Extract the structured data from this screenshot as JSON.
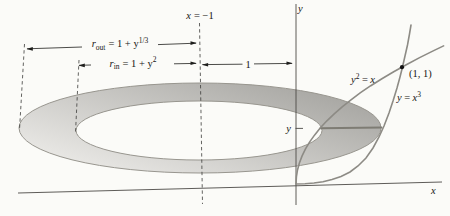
{
  "labels": {
    "rotation_axis": {
      "var": "x",
      "rest": "= −1"
    },
    "outer_radius": {
      "var": "r",
      "sub": "out",
      "rest": "= 1 + y",
      "sup": "1/3"
    },
    "inner_radius": {
      "var": "r",
      "sub": "in",
      "rest": "= 1 + y",
      "sup": "2"
    },
    "offset_one": "1",
    "parabola_label": {
      "var": "y",
      "sup": "2",
      "eq": "=",
      "var2": "x"
    },
    "cubic_label": {
      "var": "y",
      "eq": "=",
      "var2": "x",
      "sup": "3"
    },
    "point_label": "(1, 1)",
    "slice_label": "y",
    "x_axis_label": "x",
    "y_axis_label": "y"
  },
  "colors": {
    "background": "#fbfbf8",
    "washer_light": "#eeedea",
    "washer_dark": "#a7a6a2",
    "washer_stroke": "#98968f",
    "curve": "#8d8b85",
    "slice": "#7e7c74",
    "ink": "#1e1e1c"
  },
  "curves": {
    "parabola": [
      [
        296,
        184
      ],
      [
        296.4,
        177
      ],
      [
        297.5,
        170
      ],
      [
        299.4,
        163
      ],
      [
        302.1,
        155.9
      ],
      [
        305.5,
        148.9
      ],
      [
        309.7,
        141.9
      ],
      [
        314.7,
        134.9
      ],
      [
        320.4,
        127.8
      ],
      [
        326.9,
        120.8
      ],
      [
        334.2,
        113.8
      ],
      [
        342.2,
        106.8
      ],
      [
        351,
        99.8
      ],
      [
        360.5,
        92.7
      ],
      [
        370.8,
        85.7
      ],
      [
        381.9,
        78.7
      ],
      [
        393.7,
        71.7
      ],
      [
        406.3,
        64.7
      ],
      [
        419.6,
        57.6
      ],
      [
        433.7,
        50.6
      ],
      [
        443.6,
        45.9
      ]
    ],
    "cubic": [
      [
        296,
        184
      ],
      [
        305,
        183.7
      ],
      [
        314,
        183
      ],
      [
        323,
        181.7
      ],
      [
        332,
        179.5
      ],
      [
        341,
        176.5
      ],
      [
        350,
        172
      ],
      [
        358,
        166
      ],
      [
        366,
        158
      ],
      [
        373,
        148
      ],
      [
        379,
        137
      ],
      [
        384,
        126
      ],
      [
        389,
        113
      ],
      [
        393,
        101
      ],
      [
        397,
        88
      ],
      [
        400,
        77
      ],
      [
        402.5,
        67
      ],
      [
        405,
        56
      ],
      [
        407.5,
        45
      ],
      [
        409.5,
        34
      ],
      [
        411,
        25
      ]
    ],
    "slice": [
      [
        320.5,
        128.3
      ],
      [
        381.5,
        127.5
      ]
    ]
  }
}
